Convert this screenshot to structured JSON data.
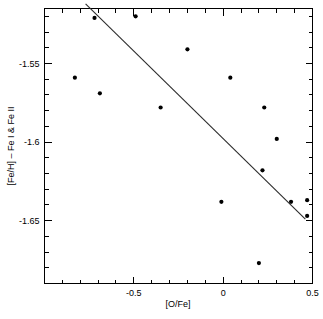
{
  "chart_data": {
    "type": "scatter",
    "title": "",
    "xlabel": "[O/Fe]",
    "ylabel": "[Fe/H] – Fe I & Fe II",
    "xlim": [
      -1.0,
      0.5
    ],
    "ylim": [
      -1.69,
      -1.515
    ],
    "grid": false,
    "legend": null,
    "xticks": [
      -0.5,
      0,
      0.5
    ],
    "xtick_labels": [
      "-0.5",
      "0",
      "0.5"
    ],
    "yticks": [
      -1.55,
      -1.6,
      -1.65
    ],
    "ytick_labels": [
      "-1.55",
      "-1.6",
      "-1.65"
    ],
    "x_minor_tick_step": 0.1,
    "y_minor_tick_step": 0.01,
    "marker": "filled-circle",
    "marker_color": "#000000",
    "marker_size_px": 4.2,
    "points": [
      {
        "x": -0.83,
        "y": -1.559
      },
      {
        "x": -0.72,
        "y": -1.521
      },
      {
        "x": -0.69,
        "y": -1.569
      },
      {
        "x": -0.49,
        "y": -1.52
      },
      {
        "x": -0.35,
        "y": -1.578
      },
      {
        "x": -0.2,
        "y": -1.541
      },
      {
        "x": -0.01,
        "y": -1.638
      },
      {
        "x": 0.04,
        "y": -1.559
      },
      {
        "x": 0.2,
        "y": -1.677
      },
      {
        "x": 0.22,
        "y": -1.618
      },
      {
        "x": 0.23,
        "y": -1.578
      },
      {
        "x": 0.3,
        "y": -1.598
      },
      {
        "x": 0.38,
        "y": -1.638
      },
      {
        "x": 0.47,
        "y": -1.637
      },
      {
        "x": 0.47,
        "y": -1.647
      }
    ],
    "fit_line": {
      "label": "linear fit",
      "color": "#2b2b2b",
      "x_start": -0.77,
      "y_start": -1.512,
      "x_end": 0.46,
      "y_end": -1.649
    }
  }
}
